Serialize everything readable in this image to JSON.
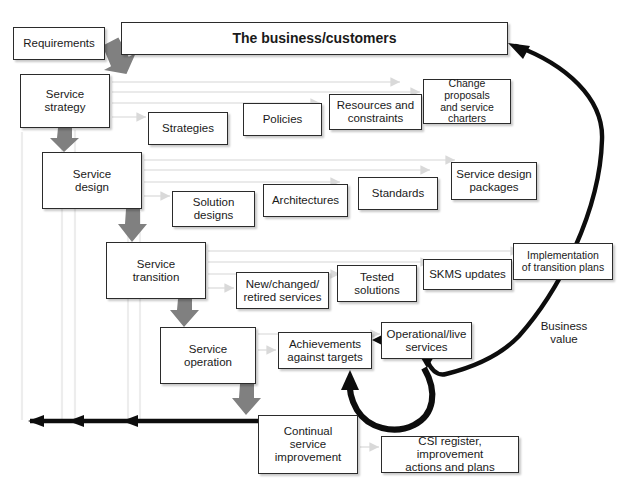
{
  "diagram": {
    "banner": {
      "label": "The business/customers"
    },
    "input": {
      "label": "Requirements"
    },
    "value_label": {
      "label": "Business\nvalue"
    },
    "lifecycle_stages": [
      {
        "id": "service-strategy",
        "label": "Service\nstrategy",
        "x": 20,
        "y": 74,
        "w": 90,
        "h": 54
      },
      {
        "id": "service-design",
        "label": "Service\ndesign",
        "x": 42,
        "y": 152,
        "w": 100,
        "h": 57
      },
      {
        "id": "service-transition",
        "label": "Service\ntransition",
        "x": 106,
        "y": 242,
        "w": 100,
        "h": 57
      },
      {
        "id": "service-operation",
        "label": "Service\noperation",
        "x": 160,
        "y": 327,
        "w": 96,
        "h": 57
      },
      {
        "id": "continual-service-improvement",
        "label": "Continual\nservice\nimprovement",
        "x": 258,
        "y": 415,
        "w": 100,
        "h": 59
      }
    ],
    "outputs": [
      {
        "id": "strategies",
        "label": "Strategies",
        "x": 148,
        "y": 112,
        "w": 80,
        "h": 33
      },
      {
        "id": "policies",
        "label": "Policies",
        "x": 243,
        "y": 103,
        "w": 79,
        "h": 33
      },
      {
        "id": "resources-constraints",
        "label": "Resources and\nconstraints",
        "x": 329,
        "y": 94,
        "w": 93,
        "h": 36
      },
      {
        "id": "change-proposals",
        "label": "Change proposals\nand service\ncharters",
        "x": 423,
        "y": 79,
        "w": 88,
        "h": 45
      },
      {
        "id": "solution-designs",
        "label": "Solution\ndesigns",
        "x": 172,
        "y": 191,
        "w": 83,
        "h": 36
      },
      {
        "id": "architectures",
        "label": "Architectures",
        "x": 263,
        "y": 184,
        "w": 85,
        "h": 33
      },
      {
        "id": "standards",
        "label": "Standards",
        "x": 358,
        "y": 177,
        "w": 80,
        "h": 33
      },
      {
        "id": "service-design-packages",
        "label": "Service design\npackages",
        "x": 451,
        "y": 162,
        "w": 86,
        "h": 38
      },
      {
        "id": "new-changed-retired-services",
        "label": "New/changed/\nretired services",
        "x": 236,
        "y": 272,
        "w": 93,
        "h": 37
      },
      {
        "id": "tested-solutions",
        "label": "Tested\nsolutions",
        "x": 337,
        "y": 265,
        "w": 80,
        "h": 37
      },
      {
        "id": "skms-updates",
        "label": "SKMS updates",
        "x": 423,
        "y": 259,
        "w": 89,
        "h": 31
      },
      {
        "id": "implementation-transition-plans",
        "label": "Implementation\nof transition plans",
        "x": 513,
        "y": 243,
        "w": 100,
        "h": 37
      },
      {
        "id": "achievements-against-targets",
        "label": "Achievements\nagainst targets",
        "x": 278,
        "y": 332,
        "w": 94,
        "h": 37
      },
      {
        "id": "operational-live-services",
        "label": "Operational/live\nservices",
        "x": 381,
        "y": 322,
        "w": 91,
        "h": 37
      },
      {
        "id": "csi-register",
        "label": "CSI register, improvement\nactions and plans",
        "x": 381,
        "y": 436,
        "w": 138,
        "h": 37
      }
    ],
    "flow_notes": {
      "lifecycle_sequence": "Requirements → Service strategy → Service design → Service transition → Service operation → Continual service improvement",
      "feedback": "Continual service improvement feeds back to Service strategy, Service design and Service transition",
      "value_return": "Business value returns from Operational/live services to The business/customers"
    }
  }
}
